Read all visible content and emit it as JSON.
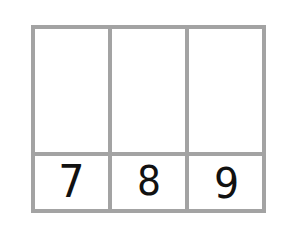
{
  "page": {
    "background_color": "#ffffff"
  },
  "grid": {
    "border_color": "#a3a3a3",
    "cell_background": "#ffffff",
    "digit_color": "#111111",
    "rows": 2,
    "columns": 3,
    "top_row": {
      "label": "empty-answer-row",
      "cells": [
        {
          "name": "cell-top-1",
          "value": ""
        },
        {
          "name": "cell-top-2",
          "value": ""
        },
        {
          "name": "cell-top-3",
          "value": ""
        }
      ]
    },
    "bottom_row": {
      "label": "digits-row",
      "cells": [
        {
          "name": "cell-bottom-1",
          "value": "7"
        },
        {
          "name": "cell-bottom-2",
          "value": "8"
        },
        {
          "name": "cell-bottom-3",
          "value": "9"
        }
      ]
    }
  }
}
